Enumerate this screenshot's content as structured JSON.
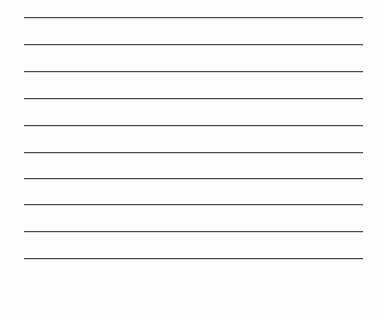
{
  "page": {
    "kind": "lined-paper-sheet",
    "width": 384,
    "height": 319,
    "background_color": "#fdfdfd",
    "has_text_content": false,
    "visible_text": []
  },
  "rules": {
    "count": 10,
    "line_color": "#4a4a4a",
    "line_thickness_px": 1,
    "left_x": 24,
    "right_x": 363,
    "line_length_px": 339,
    "spacing_px": 27,
    "top_margin_px": 17,
    "bottom_margin_px": 61,
    "y_positions": [
      17,
      44,
      71,
      98,
      125,
      152,
      178,
      204,
      231,
      258
    ],
    "items": [
      {
        "index": 1,
        "y": 17,
        "label": "rule-line-1"
      },
      {
        "index": 2,
        "y": 44,
        "label": "rule-line-2"
      },
      {
        "index": 3,
        "y": 71,
        "label": "rule-line-3"
      },
      {
        "index": 4,
        "y": 98,
        "label": "rule-line-4"
      },
      {
        "index": 5,
        "y": 125,
        "label": "rule-line-5"
      },
      {
        "index": 6,
        "y": 152,
        "label": "rule-line-6"
      },
      {
        "index": 7,
        "y": 178,
        "label": "rule-line-7"
      },
      {
        "index": 8,
        "y": 204,
        "label": "rule-line-8"
      },
      {
        "index": 9,
        "y": 231,
        "label": "rule-line-9"
      },
      {
        "index": 10,
        "y": 258,
        "label": "rule-line-10"
      }
    ]
  }
}
